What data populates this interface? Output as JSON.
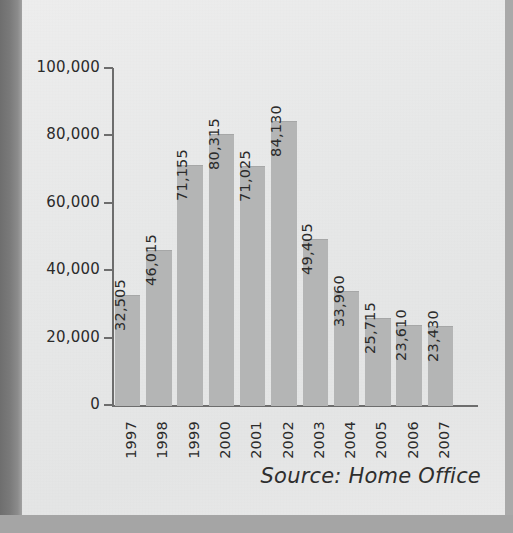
{
  "chart_data": {
    "type": "bar",
    "title": "",
    "xlabel": "",
    "ylabel": "",
    "categories": [
      "1997",
      "1998",
      "1999",
      "2000",
      "2001",
      "2002",
      "2003",
      "2004",
      "2005",
      "2006",
      "2007"
    ],
    "values": [
      32505,
      46015,
      71155,
      80315,
      71025,
      84130,
      49405,
      33960,
      25715,
      23610,
      23430
    ],
    "value_labels": [
      "32,505",
      "46,015",
      "71,155",
      "80,315",
      "71,025",
      "84,130",
      "49,405",
      "33,960",
      "25,715",
      "23,610",
      "23,430"
    ],
    "ylim": [
      0,
      100000
    ],
    "yticks": [
      0,
      20000,
      40000,
      60000,
      80000,
      100000
    ],
    "ytick_labels": [
      "0",
      "20,000",
      "40,000",
      "60,000",
      "80,000",
      "100,000"
    ],
    "grid": false,
    "legend": false,
    "bar_color": "#b4b5b5",
    "axis_color": "#6d6d6d",
    "text_color": "#2b2b2b",
    "value_label_orientation": "vertical",
    "xtick_label_orientation": "vertical"
  },
  "figure": {
    "source_note": "Source: Home Office",
    "page_background": "#e9eaea",
    "surround_background": "#a5a5a5"
  }
}
